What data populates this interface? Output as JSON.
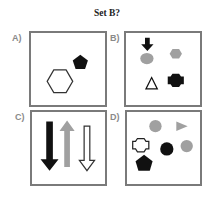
{
  "title": "Set B?",
  "colors": {
    "black": "#111111",
    "gray": "#a0a0a0",
    "border": "#7a7a7a",
    "label": "#8a8a8a"
  },
  "panels": [
    {
      "label": "A)",
      "shapes": [
        "hexagon-outline",
        "pentagon-black"
      ]
    },
    {
      "label": "B)",
      "shapes": [
        "arrow-down-black",
        "circle-gray",
        "hexagon-gray",
        "triangle-outline",
        "cross-black"
      ]
    },
    {
      "label": "C)",
      "shapes": [
        "arrow-down-black",
        "arrow-up-gray",
        "arrow-down-outline"
      ]
    },
    {
      "label": "D)",
      "shapes": [
        "circle-gray",
        "triangle-right-gray",
        "cross-outline",
        "circle-black",
        "circle-gray",
        "pentagon-black"
      ]
    }
  ]
}
